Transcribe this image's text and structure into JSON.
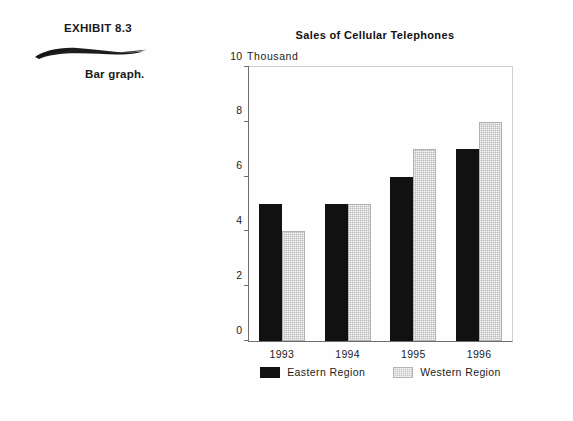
{
  "exhibit": {
    "label": "EXHIBIT 8.3",
    "caption": "Bar graph.",
    "rule_icon": "brush-stroke-icon"
  },
  "colors": {
    "page_background": "#fefefe",
    "eastern_series": "#111111",
    "western_series": "#c4c4c4",
    "axis": "#6e6e6e",
    "frame": "#cfcfcf",
    "text": "#1c1c1c"
  },
  "chart_data": {
    "type": "bar",
    "title": "Sales of Cellular Telephones",
    "xlabel": "",
    "ylabel": "Thousand",
    "categories": [
      "1993",
      "1994",
      "1995",
      "1996"
    ],
    "series": [
      {
        "name": "Eastern Region",
        "values": [
          5,
          5,
          6,
          7
        ],
        "color": "#111111"
      },
      {
        "name": "Western Region",
        "values": [
          4,
          5,
          7,
          8
        ],
        "color": "#c4c4c4"
      }
    ],
    "ylim": [
      0,
      10
    ],
    "yticks": [
      0,
      2,
      4,
      6,
      8,
      10
    ],
    "ytick_labels": [
      "0",
      "2",
      "4",
      "6",
      "8",
      "10"
    ],
    "grid": false,
    "legend_position": "bottom-center"
  }
}
